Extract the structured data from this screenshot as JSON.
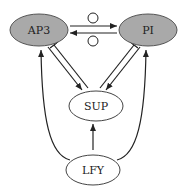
{
  "diagram": {
    "title": "",
    "nodes": [
      {
        "id": "AP3",
        "label": "AP3",
        "fill": "#a9a9a9"
      },
      {
        "id": "PI",
        "label": "PI",
        "fill": "#a9a9a9"
      },
      {
        "id": "SUP",
        "label": "SUP",
        "fill": "#ffffff"
      },
      {
        "id": "LFY",
        "label": "LFY",
        "fill": "#ffffff"
      }
    ],
    "edges": [
      {
        "from": "AP3",
        "to": "PI",
        "type": "activation",
        "note": "protein interaction circle"
      },
      {
        "from": "PI",
        "to": "AP3",
        "type": "activation",
        "note": "protein interaction circle"
      },
      {
        "from": "AP3",
        "to": "SUP",
        "type": "activation"
      },
      {
        "from": "SUP",
        "to": "AP3",
        "type": "inhibition"
      },
      {
        "from": "PI",
        "to": "SUP",
        "type": "activation"
      },
      {
        "from": "SUP",
        "to": "PI",
        "type": "inhibition"
      },
      {
        "from": "LFY",
        "to": "SUP",
        "type": "activation"
      },
      {
        "from": "LFY",
        "to": "AP3",
        "type": "activation"
      },
      {
        "from": "LFY",
        "to": "PI",
        "type": "activation"
      }
    ]
  }
}
